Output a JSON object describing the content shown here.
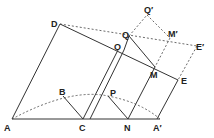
{
  "diagram": {
    "labels": {
      "A": "A",
      "B": "B",
      "C": "C",
      "D": "D",
      "E": "E",
      "M": "M",
      "N": "N",
      "O": "O",
      "P": "P",
      "Q": "Q",
      "Qp": "Q′",
      "Mp": "M′",
      "Ep": "E′",
      "Ap": "A′"
    },
    "colors": {
      "line": "#333333",
      "dashed": "#444444"
    }
  }
}
